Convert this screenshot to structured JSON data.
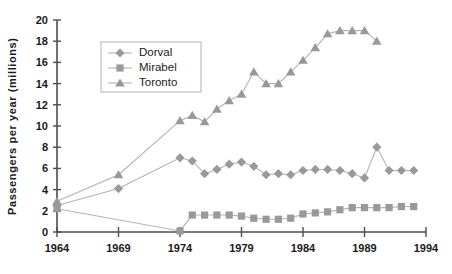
{
  "chart_data": {
    "type": "line",
    "title": "",
    "xlabel": "",
    "ylabel": "Passengers  per  year  (millions)",
    "xlim": [
      1964,
      1994
    ],
    "ylim": [
      0,
      20
    ],
    "ytick_values": [
      0,
      2,
      4,
      6,
      8,
      10,
      12,
      14,
      16,
      18,
      20
    ],
    "ytick_labels": [
      "0",
      "2",
      "4",
      "6",
      "8",
      "10",
      "12",
      "14",
      "16",
      "18",
      "20"
    ],
    "xtick_values": [
      1964,
      1969,
      1974,
      1979,
      1984,
      1989,
      1994
    ],
    "xtick_labels": [
      "1964",
      "1969",
      "1974",
      "1979",
      "1984",
      "1989",
      "1994"
    ],
    "grid": false,
    "legend_position": "upper-left-inset",
    "series": [
      {
        "name": "Dorval",
        "marker": "diamond",
        "color": "#999999",
        "line_color": "#b3b3b3",
        "x": [
          1964,
          1969,
          1974,
          1975,
          1976,
          1977,
          1978,
          1979,
          1980,
          1981,
          1982,
          1983,
          1984,
          1985,
          1986,
          1987,
          1988,
          1989,
          1990,
          1991,
          1992,
          1993
        ],
        "y": [
          2.5,
          4.1,
          7.0,
          6.7,
          5.5,
          5.9,
          6.4,
          6.6,
          6.2,
          5.4,
          5.5,
          5.4,
          5.8,
          5.9,
          5.9,
          5.8,
          5.5,
          5.1,
          8.0,
          5.8,
          5.8,
          5.8
        ]
      },
      {
        "name": "Mirabel",
        "marker": "square",
        "color": "#999999",
        "line_color": "#b3b3b3",
        "x": [
          1964,
          1974,
          1975,
          1976,
          1977,
          1978,
          1979,
          1980,
          1981,
          1982,
          1983,
          1984,
          1985,
          1986,
          1987,
          1988,
          1989,
          1990,
          1991,
          1992,
          1993
        ],
        "y": [
          2.2,
          0.1,
          1.6,
          1.6,
          1.6,
          1.6,
          1.5,
          1.3,
          1.2,
          1.2,
          1.3,
          1.7,
          1.8,
          1.9,
          2.1,
          2.3,
          2.3,
          2.3,
          2.3,
          2.4,
          2.4
        ]
      },
      {
        "name": "Toronto",
        "marker": "triangle",
        "color": "#999999",
        "line_color": "#b3b3b3",
        "x": [
          1964,
          1969,
          1974,
          1975,
          1976,
          1977,
          1978,
          1979,
          1980,
          1981,
          1982,
          1983,
          1984,
          1985,
          1986,
          1987,
          1988,
          1989,
          1990
        ],
        "y": [
          2.9,
          5.4,
          10.5,
          11.0,
          10.4,
          11.6,
          12.4,
          13.0,
          15.1,
          14.0,
          14.0,
          15.1,
          16.2,
          17.4,
          18.7,
          19.0,
          19.0,
          19.0,
          18.0
        ]
      }
    ]
  },
  "legend": {
    "entries": [
      {
        "label": "Dorval"
      },
      {
        "label": "Mirabel"
      },
      {
        "label": "Toronto"
      }
    ]
  },
  "colors": {
    "marker": "#999999",
    "line": "#b3b3b3",
    "axis": "#4d4d4d",
    "text": "#1a1a1a",
    "background": "#ffffff"
  }
}
